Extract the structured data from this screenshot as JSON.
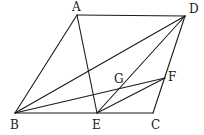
{
  "figure": {
    "type": "parallelogram-construction",
    "points": {
      "A": {
        "label": "A",
        "x": 77,
        "y": 15
      },
      "D": {
        "label": "D",
        "x": 185,
        "y": 16
      },
      "B": {
        "label": "B",
        "x": 15,
        "y": 113
      },
      "E": {
        "label": "E",
        "x": 97,
        "y": 113
      },
      "C": {
        "label": "C",
        "x": 153,
        "y": 113
      },
      "F": {
        "label": "F",
        "x": 165,
        "y": 78
      },
      "G": {
        "label": "G",
        "x": 122,
        "y": 88
      }
    },
    "segments": [
      [
        "A",
        "B"
      ],
      [
        "A",
        "D"
      ],
      [
        "D",
        "C"
      ],
      [
        "B",
        "C"
      ],
      [
        "B",
        "D"
      ],
      [
        "A",
        "E"
      ],
      [
        "D",
        "E"
      ],
      [
        "B",
        "F"
      ],
      [
        "E",
        "F"
      ]
    ],
    "labels": {
      "A": "A",
      "B": "B",
      "C": "C",
      "D": "D",
      "E": "E",
      "F": "F",
      "G": "G"
    }
  }
}
